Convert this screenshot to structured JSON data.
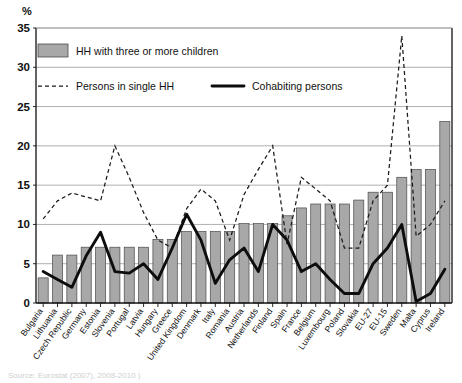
{
  "axis": {
    "unit_label": "%",
    "y_ticks": [
      "0",
      "5",
      "10",
      "15",
      "20",
      "25",
      "30",
      "35"
    ]
  },
  "legend": {
    "bar_label": "HH with three or more children",
    "dashed_label": "Persons in single HH",
    "solid_label": "Cohabiting persons"
  },
  "source": {
    "text": "Source: Eurostat (2007), 2008-2010 )"
  },
  "colors": {
    "bar_fill": "#a8a8a8",
    "bar_stroke": "#4a4a4a",
    "line_solid": "#0d0d0d",
    "line_dashed": "#1a1a1a",
    "gridline": "#9a9a9a"
  },
  "chart_data": {
    "type": "bar",
    "title": "",
    "xlabel": "",
    "ylabel": "%",
    "ylim": [
      0,
      35
    ],
    "ytick_step": 5,
    "grid": true,
    "legend_position": "top-left",
    "categories": [
      "Bulgaria",
      "Lithuania",
      "Czech Republic",
      "Germany",
      "Estonia",
      "Slovenia",
      "Portugal",
      "Latvia",
      "Hungary",
      "Greece",
      "United Kingdom",
      "Denmark",
      "Italy",
      "Romania",
      "Austria",
      "Netherlands",
      "Finland",
      "Spain",
      "France",
      "Belgium",
      "Luxembourg",
      "Poland",
      "Slovakia",
      "EU-27",
      "EU-15",
      "Sweden",
      "Malta",
      "Cyprus",
      "Ireland"
    ],
    "series": [
      {
        "name": "HH with three or more children",
        "render": "bar",
        "values": [
          3.2,
          6.1,
          6.1,
          7.1,
          7.1,
          7.1,
          7.1,
          7.1,
          8.1,
          8.1,
          9.1,
          9.1,
          9.1,
          9.1,
          10.1,
          10.1,
          10.1,
          11.1,
          12.1,
          12.6,
          12.6,
          12.6,
          13.1,
          14.1,
          14.1,
          16.0,
          17.0,
          17.0,
          23.1
        ]
      },
      {
        "name": "Persons in single HH",
        "render": "dashed-line",
        "values": [
          10.7,
          13.0,
          14.0,
          13.5,
          13.0,
          20.0,
          16.0,
          11.5,
          8.0,
          7.0,
          12.0,
          14.5,
          13.0,
          8.0,
          13.8,
          17.0,
          20.0,
          7.5,
          16.0,
          14.5,
          13.0,
          7.0,
          7.0,
          13.0,
          15.0,
          34.0,
          8.5,
          10.0,
          13.0
        ]
      },
      {
        "name": "Cohabiting persons",
        "render": "solid-line",
        "values": [
          4.0,
          3.0,
          2.0,
          6.0,
          9.0,
          4.0,
          3.8,
          5.0,
          3.0,
          7.0,
          11.3,
          8.0,
          2.5,
          5.5,
          7.0,
          4.0,
          10.0,
          8.0,
          4.0,
          5.0,
          3.0,
          1.2,
          1.2,
          5.0,
          7.0,
          10.0,
          0.2,
          1.2,
          4.3
        ]
      }
    ]
  }
}
